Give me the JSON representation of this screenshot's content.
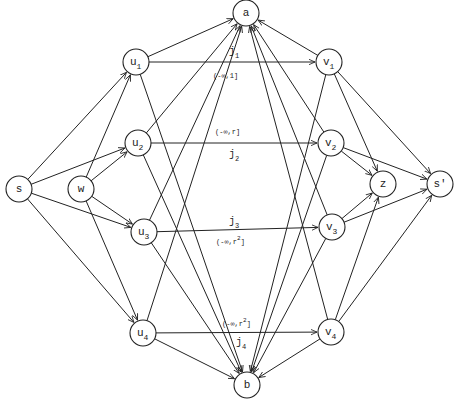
{
  "diagram": {
    "type": "directed-graph",
    "nodes": [
      {
        "id": "a",
        "label": "a",
        "sub": "",
        "x": 246,
        "y": 13
      },
      {
        "id": "u1",
        "label": "u",
        "sub": "1",
        "x": 136,
        "y": 62
      },
      {
        "id": "v1",
        "label": "v",
        "sub": "1",
        "x": 329,
        "y": 62
      },
      {
        "id": "u2",
        "label": "u",
        "sub": "2",
        "x": 138,
        "y": 143
      },
      {
        "id": "v2",
        "label": "v",
        "sub": "2",
        "x": 331,
        "y": 143
      },
      {
        "id": "s",
        "label": "s",
        "sub": "",
        "x": 19,
        "y": 189
      },
      {
        "id": "w",
        "label": "w",
        "sub": "",
        "x": 81,
        "y": 189
      },
      {
        "id": "z",
        "label": "z",
        "sub": "",
        "x": 383,
        "y": 184
      },
      {
        "id": "sp",
        "label": "s'",
        "sub": "",
        "x": 440,
        "y": 184
      },
      {
        "id": "u3",
        "label": "u",
        "sub": "3",
        "x": 144,
        "y": 232
      },
      {
        "id": "v3",
        "label": "v",
        "sub": "3",
        "x": 332,
        "y": 227
      },
      {
        "id": "u4",
        "label": "u",
        "sub": "4",
        "x": 143,
        "y": 333
      },
      {
        "id": "v4",
        "label": "v",
        "sub": "4",
        "x": 331,
        "y": 332
      },
      {
        "id": "b",
        "label": "b",
        "sub": "",
        "x": 247,
        "y": 385
      }
    ],
    "edges": [
      {
        "from": "s",
        "to": "u1"
      },
      {
        "from": "s",
        "to": "u2"
      },
      {
        "from": "s",
        "to": "u3"
      },
      {
        "from": "s",
        "to": "u4"
      },
      {
        "from": "w",
        "to": "u1"
      },
      {
        "from": "w",
        "to": "u2"
      },
      {
        "from": "w",
        "to": "u3"
      },
      {
        "from": "w",
        "to": "u4"
      },
      {
        "from": "u1",
        "to": "a"
      },
      {
        "from": "u1",
        "to": "v1"
      },
      {
        "from": "u1",
        "to": "b"
      },
      {
        "from": "u2",
        "to": "a"
      },
      {
        "from": "u2",
        "to": "v2"
      },
      {
        "from": "u2",
        "to": "b"
      },
      {
        "from": "u3",
        "to": "a"
      },
      {
        "from": "u3",
        "to": "v3"
      },
      {
        "from": "u3",
        "to": "b"
      },
      {
        "from": "u4",
        "to": "a"
      },
      {
        "from": "u4",
        "to": "v4"
      },
      {
        "from": "u4",
        "to": "b"
      },
      {
        "from": "v1",
        "to": "a"
      },
      {
        "from": "v1",
        "to": "b"
      },
      {
        "from": "v1",
        "to": "z"
      },
      {
        "from": "v1",
        "to": "sp"
      },
      {
        "from": "v2",
        "to": "a"
      },
      {
        "from": "v2",
        "to": "b"
      },
      {
        "from": "v2",
        "to": "z"
      },
      {
        "from": "v2",
        "to": "sp"
      },
      {
        "from": "v3",
        "to": "a"
      },
      {
        "from": "v3",
        "to": "b"
      },
      {
        "from": "v3",
        "to": "z"
      },
      {
        "from": "v3",
        "to": "sp"
      },
      {
        "from": "v4",
        "to": "a"
      },
      {
        "from": "v4",
        "to": "b"
      },
      {
        "from": "v4",
        "to": "z"
      },
      {
        "from": "v4",
        "to": "sp"
      }
    ],
    "edge_labels": [
      {
        "edge": "u1->v1",
        "name": "j",
        "name_sub": "1",
        "name_x": 229,
        "name_y": 54,
        "interval": "(-∞,1]",
        "interval_sup": "",
        "interval_x": 213,
        "interval_y": 78
      },
      {
        "edge": "u2->v2",
        "name": "j",
        "name_sub": "2",
        "name_x": 229,
        "name_y": 157,
        "interval": "(-∞,r]",
        "interval_sup": "",
        "interval_x": 215,
        "interval_y": 134
      },
      {
        "edge": "u3->v3",
        "name": "j",
        "name_sub": "3",
        "name_x": 229,
        "name_y": 224,
        "interval": "(-∞,r",
        "interval_sup": "2",
        "interval_x": 216,
        "interval_y": 244
      },
      {
        "edge": "u4->v4",
        "name": "j",
        "name_sub": "4",
        "name_x": 236,
        "name_y": 345,
        "interval": "(-∞,r",
        "interval_sup": "2",
        "interval_x": 222,
        "interval_y": 326
      }
    ]
  }
}
